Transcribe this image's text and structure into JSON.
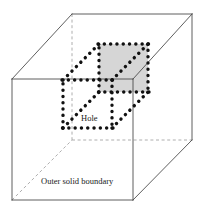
{
  "figure": {
    "type": "3d-diagram",
    "background_color": "#ffffff",
    "labels": [
      {
        "id": "hole",
        "text": "Hole",
        "x": 81,
        "y": 114
      },
      {
        "id": "outer",
        "text": "Outer solid boundary",
        "x": 41,
        "y": 177
      }
    ],
    "styles": {
      "outer_edge_color": "#4d4d4d",
      "outer_hidden_edge_color": "#999999",
      "hole_edge_color": "#111111",
      "hole_face_fill": "#d6d6d6",
      "outer_edge_width": 0.9,
      "outer_hidden_edge_width": 0.8,
      "hole_edge_width": 3.4,
      "hole_dash_pattern": "0.1 6.2"
    },
    "outer_solid": {
      "name": "Outer solid boundary",
      "front_face": [
        [
          12,
          79
        ],
        [
          133,
          79
        ],
        [
          133,
          200
        ],
        [
          12,
          200
        ]
      ],
      "back_face": [
        [
          72,
          14
        ],
        [
          192,
          14
        ],
        [
          192,
          140
        ],
        [
          72,
          140
        ]
      ],
      "visible_edges": [
        [
          [
            12,
            79
          ],
          [
            133,
            79
          ]
        ],
        [
          [
            133,
            79
          ],
          [
            133,
            200
          ]
        ],
        [
          [
            12,
            200
          ],
          [
            133,
            200
          ]
        ],
        [
          [
            12,
            79
          ],
          [
            12,
            200
          ]
        ],
        [
          [
            72,
            14
          ],
          [
            192,
            14
          ]
        ],
        [
          [
            192,
            14
          ],
          [
            192,
            140
          ]
        ],
        [
          [
            12,
            79
          ],
          [
            72,
            14
          ]
        ],
        [
          [
            133,
            79
          ],
          [
            192,
            14
          ]
        ],
        [
          [
            133,
            200
          ],
          [
            192,
            140
          ]
        ]
      ],
      "hidden_edges": [
        [
          [
            72,
            14
          ],
          [
            72,
            140
          ]
        ],
        [
          [
            72,
            140
          ],
          [
            192,
            140
          ]
        ],
        [
          [
            12,
            200
          ],
          [
            72,
            140
          ]
        ]
      ]
    },
    "hole": {
      "name": "Hole",
      "front_face": [
        [
          63,
          80
        ],
        [
          112,
          80
        ],
        [
          112,
          128
        ],
        [
          63,
          128
        ]
      ],
      "back_face": [
        [
          99,
          44
        ],
        [
          148,
          44
        ],
        [
          148,
          92
        ],
        [
          99,
          92
        ]
      ],
      "shaded_face": [
        [
          99,
          44
        ],
        [
          148,
          44
        ],
        [
          148,
          92
        ],
        [
          99,
          92
        ]
      ],
      "connector_edges": [
        [
          [
            63,
            80
          ],
          [
            99,
            44
          ]
        ],
        [
          [
            112,
            80
          ],
          [
            148,
            44
          ]
        ],
        [
          [
            112,
            128
          ],
          [
            148,
            92
          ]
        ],
        [
          [
            63,
            128
          ],
          [
            99,
            92
          ]
        ]
      ]
    }
  }
}
